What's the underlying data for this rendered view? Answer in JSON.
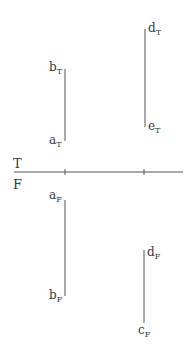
{
  "diagram": {
    "type": "orthographic-projection",
    "colors": {
      "line": "#555555",
      "text": "#3a3a3a",
      "background": "#ffffff"
    },
    "reference_line": {
      "label_top": "T",
      "label_bottom": "F",
      "x1": 14,
      "x2": 183,
      "y": 172,
      "ticks": [
        65,
        144
      ]
    },
    "top_view": {
      "segments": [
        {
          "name": "ab",
          "x": 65,
          "y1": 69,
          "y2": 141,
          "labels": [
            {
              "base": "b",
              "sub": "T",
              "x": 49,
              "y": 71
            },
            {
              "base": "a",
              "sub": "T",
              "x": 49,
              "y": 144
            }
          ]
        },
        {
          "name": "de",
          "x": 145,
          "y1": 29,
          "y2": 127,
          "labels": [
            {
              "base": "d",
              "sub": "T",
              "x": 148,
              "y": 32
            },
            {
              "base": "e",
              "sub": "T",
              "x": 148,
              "y": 130
            }
          ]
        }
      ]
    },
    "front_view": {
      "segments": [
        {
          "name": "ab",
          "x": 65,
          "y1": 200,
          "y2": 296,
          "labels": [
            {
              "base": "a",
              "sub": "F",
              "x": 49,
              "y": 199
            },
            {
              "base": "b",
              "sub": "F",
              "x": 49,
              "y": 299
            }
          ]
        },
        {
          "name": "dc",
          "x": 144,
          "y1": 250,
          "y2": 323,
          "labels": [
            {
              "base": "d",
              "sub": "F",
              "x": 147,
              "y": 256
            },
            {
              "base": "c",
              "sub": "F",
              "x": 138,
              "y": 334
            }
          ]
        }
      ]
    }
  }
}
